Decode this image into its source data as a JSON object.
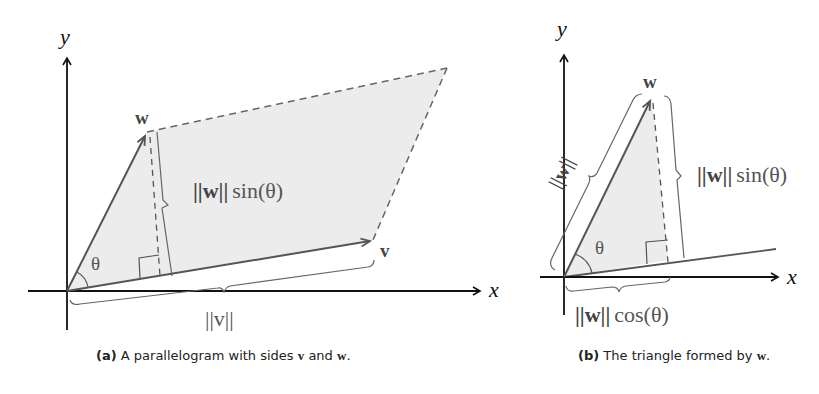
{
  "figure_a": {
    "axis_x_label": "x",
    "axis_y_label": "y",
    "vector_v_label": "v",
    "vector_w_label": "w",
    "angle_label": "θ",
    "height_label_norm": "||w||",
    "height_label_fn": "sin(θ)",
    "base_label": "||v||",
    "caption": {
      "tag": "(a)",
      "text": "A parallelogram with sides",
      "v": "v",
      "and": "and",
      "w": "w",
      "end": "."
    }
  },
  "figure_b": {
    "axis_x_label": "x",
    "axis_y_label": "y",
    "vector_w_label": "w",
    "angle_label": "θ",
    "hyp_label": "||w||",
    "height_label_norm": "||w||",
    "height_label_fn": "sin(θ)",
    "base_label_norm": "||w||",
    "base_label_fn": "cos(θ)",
    "caption": {
      "tag": "(b)",
      "text": "The triangle formed by",
      "w": "w",
      "end": "."
    }
  },
  "colors": {
    "fill": "#ececec",
    "vector": "#555555",
    "axis": "#111111",
    "dashed": "#666666"
  }
}
